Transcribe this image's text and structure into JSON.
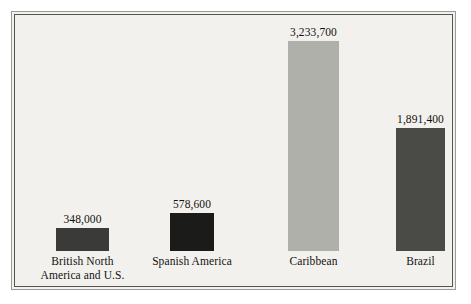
{
  "chart_data": {
    "type": "bar",
    "title": "",
    "subtitle": "",
    "xlabel": "",
    "ylabel": "",
    "grid": false,
    "legend": "none",
    "ylim": [
      0,
      3233700
    ],
    "categories": [
      "British North America and U.S.",
      "Spanish America",
      "Caribbean",
      "Brazil"
    ],
    "values": [
      348000,
      578600,
      3233700,
      1891400
    ],
    "value_labels": [
      "348,000",
      "578,600",
      "3,233,700",
      "1,891,400"
    ],
    "bar_colors": [
      "#3a3a38",
      "#1b1b19",
      "#b0b0ab",
      "#4a4a47"
    ]
  },
  "bars": [
    {
      "name": "british-north-america-and-us",
      "value_label": "348,000",
      "label_line1": "British North",
      "label_line2": "America and U.S.",
      "color": "#3a3a38",
      "left_px": 44,
      "width_px": 53,
      "height_px": 23
    },
    {
      "name": "spanish-america",
      "value_label": "578,600",
      "label_line1": "Spanish America",
      "label_line2": "",
      "color": "#1b1b19",
      "left_px": 158,
      "width_px": 44,
      "height_px": 38
    },
    {
      "name": "caribbean",
      "value_label": "3,233,700",
      "label_line1": "Caribbean",
      "label_line2": "",
      "color": "#b0b0ab",
      "left_px": 276,
      "width_px": 51,
      "height_px": 210
    },
    {
      "name": "brazil",
      "value_label": "1,891,400",
      "label_line1": "Brazil",
      "label_line2": "",
      "color": "#4a4a47",
      "left_px": 384,
      "width_px": 49,
      "height_px": 123
    }
  ]
}
